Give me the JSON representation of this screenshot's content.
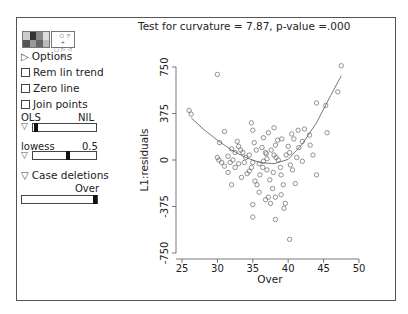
{
  "window": {
    "title": "Test for curvature = 7.87, p-value =.000"
  },
  "controls": {
    "palette_icon": "color-palette-icon",
    "symbols_icon": "point-symbols-icon",
    "options_label": "Options",
    "rem_lin_trend_label": "Rem lin trend",
    "zero_line_label": "Zero line",
    "join_points_label": "Join points",
    "ols_label": "OLS",
    "ols_value": "NIL",
    "lowess_label": "lowess",
    "lowess_value": "0.5",
    "case_deletions_label": "Case deletions",
    "case_deletions_var": "Over",
    "checkboxes": {
      "rem_lin_trend": false,
      "zero_line": false,
      "join_points": false
    },
    "colors": {
      "frame": "#555555",
      "points": "#666666",
      "curve": "#555555"
    }
  },
  "chart_data": {
    "type": "scatter",
    "title": "Test for curvature = 7.87, p-value =.000",
    "xlabel": "Over",
    "ylabel": "L1:residuals",
    "xlim": [
      25,
      50
    ],
    "ylim": [
      -750,
      750
    ],
    "xticks": [
      25,
      30,
      35,
      40,
      45,
      50
    ],
    "yticks": [
      -750,
      -375,
      0,
      375,
      750
    ],
    "ytick_labels": [
      "-750",
      "-375",
      "0",
      "375",
      "750"
    ],
    "grid": false,
    "legend": null,
    "points": [
      [
        26.0,
        400
      ],
      [
        26.3,
        370
      ],
      [
        30.0,
        690
      ],
      [
        30.2,
        0
      ],
      [
        30.6,
        -20
      ],
      [
        30.0,
        20
      ],
      [
        31.0,
        230
      ],
      [
        30.3,
        140
      ],
      [
        32.5,
        60
      ],
      [
        31.5,
        30
      ],
      [
        32.0,
        90
      ],
      [
        31.8,
        -20
      ],
      [
        32.2,
        0
      ],
      [
        31.0,
        -50
      ],
      [
        32.8,
        150
      ],
      [
        33.0,
        110
      ],
      [
        33.3,
        80
      ],
      [
        33.6,
        60
      ],
      [
        34.0,
        20
      ],
      [
        33.0,
        -30
      ],
      [
        32.5,
        -60
      ],
      [
        31.5,
        -100
      ],
      [
        33.4,
        -140
      ],
      [
        34.2,
        -110
      ],
      [
        34.5,
        40
      ],
      [
        34.8,
        300
      ],
      [
        35.0,
        240
      ],
      [
        35.2,
        140
      ],
      [
        35.5,
        80
      ],
      [
        35.0,
        -20
      ],
      [
        34.8,
        -60
      ],
      [
        35.3,
        -170
      ],
      [
        35.6,
        -200
      ],
      [
        35.9,
        -260
      ],
      [
        36.0,
        -120
      ],
      [
        36.3,
        100
      ],
      [
        36.5,
        180
      ],
      [
        36.8,
        60
      ],
      [
        37.0,
        10
      ],
      [
        37.0,
        -80
      ],
      [
        37.4,
        -160
      ],
      [
        37.2,
        -300
      ],
      [
        37.5,
        -350
      ],
      [
        37.8,
        -230
      ],
      [
        38.0,
        40
      ],
      [
        38.2,
        120
      ],
      [
        38.0,
        260
      ],
      [
        38.5,
        160
      ],
      [
        38.6,
        0
      ],
      [
        38.9,
        -60
      ],
      [
        39.0,
        -120
      ],
      [
        39.3,
        -200
      ],
      [
        39.0,
        -280
      ],
      [
        39.6,
        -350
      ],
      [
        39.4,
        -390
      ],
      [
        40.0,
        110
      ],
      [
        40.2,
        60
      ],
      [
        40.5,
        210
      ],
      [
        40.8,
        170
      ],
      [
        40.3,
        -40
      ],
      [
        41.0,
        -190
      ],
      [
        41.2,
        20
      ],
      [
        41.5,
        100
      ],
      [
        41.4,
        240
      ],
      [
        42.0,
        150
      ],
      [
        42.3,
        250
      ],
      [
        42.0,
        -10
      ],
      [
        43.0,
        200
      ],
      [
        43.5,
        40
      ],
      [
        44.0,
        460
      ],
      [
        45.3,
        440
      ],
      [
        45.5,
        220
      ],
      [
        36.9,
        50
      ],
      [
        37.6,
        80
      ],
      [
        38.3,
        20
      ],
      [
        39.7,
        40
      ],
      [
        35.9,
        -30
      ],
      [
        36.4,
        -60
      ],
      [
        33.8,
        -20
      ],
      [
        34.5,
        -90
      ],
      [
        35.0,
        -460
      ],
      [
        38.2,
        -480
      ],
      [
        40.2,
        -640
      ],
      [
        38.2,
        -300
      ],
      [
        36.8,
        -320
      ],
      [
        35.0,
        -360
      ],
      [
        36.5,
        -10
      ],
      [
        37.9,
        -100
      ],
      [
        39.1,
        170
      ],
      [
        40.6,
        -80
      ],
      [
        47.0,
        550
      ],
      [
        47.5,
        760
      ],
      [
        32.0,
        -200
      ],
      [
        44.0,
        -120
      ],
      [
        43.1,
        120
      ],
      [
        37.2,
        220
      ]
    ],
    "lowess_curve": [
      [
        26.3,
        340
      ],
      [
        28,
        250
      ],
      [
        30,
        160
      ],
      [
        32,
        80
      ],
      [
        34,
        20
      ],
      [
        36,
        -20
      ],
      [
        38,
        -30
      ],
      [
        40,
        5
      ],
      [
        42,
        130
      ],
      [
        44,
        300
      ],
      [
        46,
        520
      ],
      [
        47.5,
        680
      ]
    ]
  }
}
